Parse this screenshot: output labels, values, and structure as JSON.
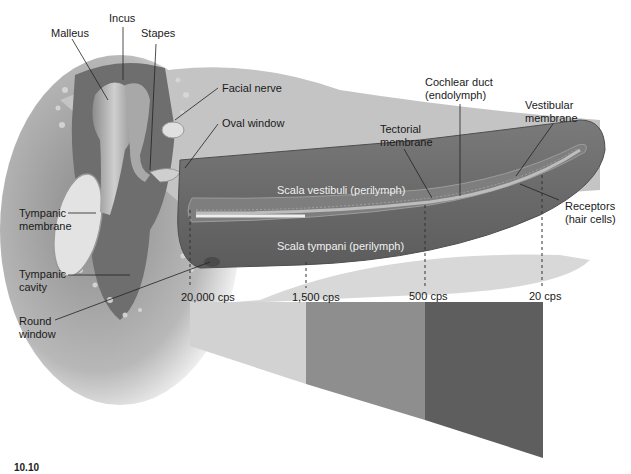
{
  "figure": {
    "number": "10.10"
  },
  "labels": {
    "incus": "Incus",
    "malleus": "Malleus",
    "stapes": "Stapes",
    "facial_nerve": "Facial nerve",
    "oval_window": "Oval window",
    "tympanic_membrane": "Tympanic\nmembrane",
    "tympanic_cavity": "Tympanic\ncavity",
    "round_window": "Round\nwindow",
    "cochlear_duct": "Cochlear duct\n(endolymph)",
    "tectorial_membrane": "Tectorial\nmembrane",
    "vestibular_membrane": "Vestibular\nmembrane",
    "receptors": "Receptors\n(hair cells)",
    "scala_vestibuli": "Scala vestibuli (perilymph)",
    "scala_tympani": "Scala tympani (perilymph)"
  },
  "frequency_scale": {
    "markers": [
      {
        "label": "20,000 cps",
        "x": 190
      },
      {
        "label": "1,500 cps",
        "x": 306
      },
      {
        "label": "500 cps",
        "x": 425
      },
      {
        "label": "20 cps",
        "x": 542
      }
    ],
    "bands": [
      {
        "name": "high-frequency-band",
        "color": "#d2d2d2"
      },
      {
        "name": "mid-frequency-band",
        "color": "#8e8e8e"
      },
      {
        "name": "low-frequency-band",
        "color": "#5e5e5e"
      }
    ]
  },
  "colors": {
    "bone": "#bdbdbd",
    "cavity": "#6e6e6e",
    "tube_outer": "#6a6a6a",
    "tube_inner": "#7b7b7b",
    "duct": "#a8a8a8"
  }
}
